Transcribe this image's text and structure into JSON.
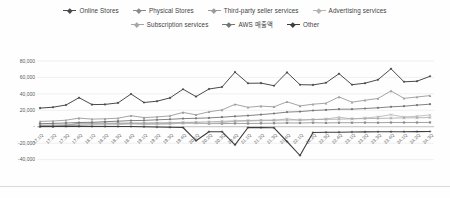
{
  "figure_title": "",
  "colors": {
    "background": "#fefefe",
    "gridline": "#e9e9e9",
    "zero_axis": "#b5b5b5",
    "tick_label": "#595959",
    "legend_text": "#3f3f3f",
    "bottom_border": "#cfcfcf"
  },
  "chart_data": {
    "type": "line",
    "title": "",
    "xlabel": "",
    "ylabel": "",
    "grid": true,
    "legend_position": "top",
    "ylim": [
      -40000,
      80000
    ],
    "ytick_values": [
      80000,
      60000,
      40000,
      20000,
      0,
      -20000,
      -40000
    ],
    "ytick_labels": [
      "80,000",
      "60,000",
      "40,000",
      "20,000",
      "-",
      "-20,000",
      "-40,000"
    ],
    "categories": [
      "17.1Q",
      "17.2Q",
      "17.3Q",
      "17.4Q",
      "18.1Q",
      "18.2Q",
      "18.3Q",
      "18.4Q",
      "19.1Q",
      "19.2Q",
      "19.3Q",
      "19.4Q",
      "20.1Q",
      "20.2Q",
      "20.3Q",
      "20.4Q",
      "21.1Q",
      "21.2Q",
      "21.3Q",
      "21.4Q",
      "22.1Q",
      "22.2Q",
      "22.3Q",
      "22.4Q",
      "23.1Q",
      "23.2Q",
      "23.3Q",
      "23.4Q",
      "24.1Q",
      "24.2Q",
      "24.3Q"
    ],
    "legend_rows": [
      [
        0,
        1,
        2,
        3
      ],
      [
        4,
        5,
        6
      ]
    ],
    "series": [
      {
        "name": "Online Stores",
        "id": "online-stores",
        "color": "#4a4a4a",
        "width": 1.0,
        "marker": "diamond",
        "values": [
          22727,
          23754,
          26392,
          35383,
          26939,
          27165,
          29061,
          39822,
          29498,
          31053,
          35039,
          45657,
          36652,
          45896,
          48350,
          66451,
          52901,
          53157,
          49942,
          66075,
          51129,
          50855,
          53489,
          64531,
          51096,
          52966,
          57267,
          70528,
          54670,
          55392,
          61411
        ]
      },
      {
        "name": "Physical Stores",
        "id": "physical-stores",
        "color": "#8a8a8a",
        "width": 0.8,
        "marker": "square",
        "values": [
          0,
          0,
          1276,
          4522,
          4263,
          4312,
          4248,
          4401,
          4307,
          4330,
          4192,
          4363,
          4640,
          3774,
          3788,
          4022,
          3920,
          4198,
          4269,
          4688,
          4591,
          4968,
          4694,
          4957,
          4895,
          5024,
          4959,
          5152,
          5202,
          5206,
          5228
        ]
      },
      {
        "name": "Third-party seller services",
        "id": "third-party-seller-services",
        "color": "#9b9b9b",
        "width": 0.9,
        "marker": "triangle",
        "values": [
          6438,
          6991,
          7928,
          10523,
          9265,
          9702,
          10395,
          13383,
          11141,
          11962,
          13212,
          17446,
          14479,
          18195,
          20436,
          27327,
          23709,
          25085,
          24252,
          30320,
          25335,
          27376,
          28666,
          36339,
          29820,
          32332,
          34342,
          43559,
          34596,
          36201,
          37869
        ]
      },
      {
        "name": "Advertising services",
        "id": "advertising-services",
        "color": "#b3b3b3",
        "width": 0.8,
        "marker": "x",
        "values": [
          850,
          945,
          1120,
          1735,
          2031,
          2194,
          2495,
          3388,
          2716,
          2980,
          3206,
          4768,
          3906,
          4221,
          4926,
          6720,
          6905,
          7451,
          7612,
          9716,
          7877,
          8757,
          9548,
          11557,
          9509,
          10683,
          12060,
          14654,
          11824,
          12771,
          14331
        ]
      },
      {
        "name": "Subscription services",
        "id": "subscription-services",
        "color": "#a6a6a6",
        "width": 0.8,
        "marker": "asterisk",
        "values": [
          1939,
          2165,
          2441,
          3177,
          3102,
          3408,
          3698,
          3959,
          4342,
          4676,
          4957,
          5235,
          5556,
          6018,
          6572,
          7061,
          7580,
          7917,
          8148,
          8123,
          8410,
          8716,
          8903,
          9189,
          9657,
          9894,
          10170,
          10488,
          10722,
          10866,
          11278
        ]
      },
      {
        "name": "AWS 매출액",
        "id": "aws-revenue",
        "color": "#757575",
        "width": 0.9,
        "marker": "circle",
        "values": [
          3661,
          4100,
          4584,
          5113,
          5442,
          6105,
          6679,
          7430,
          7696,
          8381,
          8995,
          9954,
          10219,
          10808,
          11601,
          12742,
          13503,
          14809,
          16110,
          17780,
          18441,
          19739,
          20538,
          21378,
          21354,
          22140,
          23059,
          24204,
          25037,
          26281,
          27452
        ]
      },
      {
        "name": "Other",
        "id": "other",
        "color": "#3d3d3d",
        "width": 1.1,
        "marker": "plus",
        "values": [
          450,
          420,
          390,
          360,
          330,
          300,
          270,
          240,
          0,
          -300,
          -600,
          -900,
          -17000,
          -6000,
          -6000,
          -22000,
          -900,
          -1000,
          -1300,
          -18000,
          -35000,
          -7000,
          -6800,
          -6600,
          -6400,
          -6300,
          -6200,
          -6100,
          -6000,
          -5900,
          -5800
        ]
      }
    ]
  }
}
